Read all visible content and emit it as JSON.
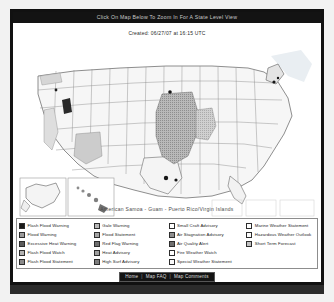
{
  "page": {
    "banner_title": "Click On Map Below To Zoom In For A State Level View",
    "created_text": "Created: 06/27/07 at 16:15 UTC",
    "territory_line": "American Samoa  -  Guam  -  Puerto Rico/Virgin Islands"
  },
  "legend": {
    "columns": [
      {
        "items": [
          {
            "label": "Flash Flood Warning",
            "color": "#1a1a1a"
          },
          {
            "label": "Flood Warning",
            "color": "#9c9c9c"
          },
          {
            "label": "Excessive Heat Warning",
            "color": "#5d5d5d"
          },
          {
            "label": "Flash Flood Watch",
            "color": "#b3b3b3"
          },
          {
            "label": "Flash Flood Statement",
            "color": "#8a8a8a"
          }
        ]
      },
      {
        "items": [
          {
            "label": "Gale Warning",
            "color": "#b8b8b8"
          },
          {
            "label": "Flood Statement",
            "color": "#a5a5a5"
          },
          {
            "label": "Red Flag Warning",
            "color": "#6e6e6e"
          },
          {
            "label": "Heat Advisory",
            "color": "#a0a0a0"
          },
          {
            "label": "High Surf Advisory",
            "color": "#7d7d7d"
          }
        ]
      },
      {
        "items": [
          {
            "label": "Small Craft Advisory",
            "color": "#ffffff"
          },
          {
            "label": "Air Stagnation Advisory",
            "color": "#8f8f8f"
          },
          {
            "label": "Air Quality Alert",
            "color": "#707070"
          },
          {
            "label": "Fire Weather Watch",
            "color": "#ffffff"
          },
          {
            "label": "Special Weather Statement",
            "color": "#fafafa"
          }
        ]
      },
      {
        "items": [
          {
            "label": "Marine Weather Statement",
            "color": "#fdfdfd"
          },
          {
            "label": "Hazardous Weather Outlook",
            "color": "#fbfbfb"
          },
          {
            "label": "Short Term Forecast",
            "color": "#c2c2c2"
          }
        ]
      }
    ]
  },
  "footer": {
    "home_label": "Home",
    "sep1": "|",
    "faq_label": "Map FAQ",
    "sep2": "|",
    "comments_label": "Map Comments"
  },
  "map": {
    "alt": "United States watches warnings and advisories map",
    "insets": [
      "Alaska",
      "Hawaii"
    ]
  }
}
